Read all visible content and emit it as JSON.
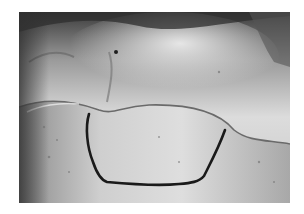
{
  "image": {
    "kind": "grayscale surgical photograph",
    "subject": "tissue surface with a marked outline incision drawn as a dark line",
    "background_color": "#ffffff",
    "photo_bounds": {
      "x": 19,
      "y": 12,
      "width": 271,
      "height": 191
    },
    "palette": {
      "dark_top": "#3a3a3a",
      "mid_gray": "#8c8c8c",
      "light_tissue": "#d8d8d8",
      "highlight": "#eeeeee",
      "outline_mark": "#1a1a1a"
    },
    "regions": [
      {
        "name": "upper-tissue-layer",
        "description": "lighter glossy tissue in the upper half, darker at the top edge"
      },
      {
        "name": "fold-line",
        "description": "curved fold separating the upper layer from the lower flap"
      },
      {
        "name": "lower-flap",
        "description": "light gray tissue in the lower half"
      },
      {
        "name": "outlined-area",
        "description": "region enclosed by a dark drawn outline"
      }
    ]
  }
}
